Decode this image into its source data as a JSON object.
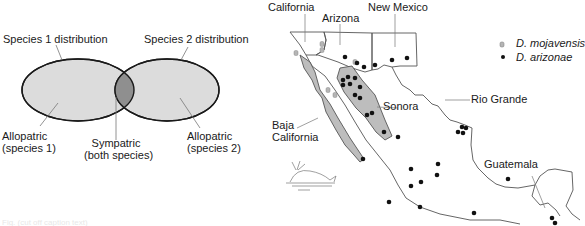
{
  "venn": {
    "labels": {
      "species1_distribution": "Species 1 distribution",
      "species2_distribution": "Species 2 distribution",
      "allopatric1_line1": "Allopatric",
      "allopatric1_line2": "(species 1)",
      "sympatric_line1": "Sympatric",
      "sympatric_line2": "(both species)",
      "allopatric2_line1": "Allopatric",
      "allopatric2_line2": "(species 2)"
    },
    "colors": {
      "fill": "#dcdcdc",
      "overlap": "#8f8f8f",
      "stroke": "#1a1a1a"
    }
  },
  "map": {
    "region_labels": {
      "california": "California",
      "arizona": "Arizona",
      "new_mexico": "New Mexico",
      "sonora": "Sonora",
      "rio_grande": "Rio Grande",
      "baja_california_line1": "Baja",
      "baja_california_line2": "California",
      "guatemala": "Guatemala"
    },
    "legend": [
      {
        "symbol": "gray-marker",
        "label": "D. mojavensis"
      },
      {
        "symbol": "black-dot",
        "label": "D. arizonae"
      }
    ],
    "colors": {
      "shaded_region": "#bdbdbd",
      "outline": "#555555",
      "arizonae_dot": "#111111",
      "mojavensis_marker": "#b5b5b5"
    },
    "arizonae_points": [
      [
        345,
        57
      ],
      [
        357,
        63
      ],
      [
        364,
        67
      ],
      [
        375,
        65
      ],
      [
        392,
        60
      ],
      [
        407,
        58
      ],
      [
        343,
        80
      ],
      [
        348,
        77
      ],
      [
        355,
        78
      ],
      [
        350,
        84
      ],
      [
        343,
        85
      ],
      [
        360,
        87
      ],
      [
        355,
        95
      ],
      [
        360,
        98
      ],
      [
        367,
        115
      ],
      [
        372,
        113
      ],
      [
        384,
        132
      ],
      [
        398,
        137
      ],
      [
        363,
        159
      ],
      [
        438,
        164
      ],
      [
        411,
        169
      ],
      [
        421,
        182
      ],
      [
        411,
        186
      ],
      [
        389,
        202
      ],
      [
        462,
        127
      ],
      [
        458,
        132
      ],
      [
        463,
        133
      ],
      [
        466,
        128
      ],
      [
        437,
        175
      ],
      [
        420,
        207
      ],
      [
        474,
        213
      ],
      [
        508,
        179
      ],
      [
        552,
        218
      ],
      [
        555,
        223
      ]
    ],
    "mojavensis_points": [
      [
        322,
        44
      ],
      [
        322,
        50
      ],
      [
        296,
        53
      ],
      [
        355,
        62
      ],
      [
        328,
        90
      ],
      [
        335,
        95
      ]
    ]
  },
  "caption": "Fig. (cut off caption text)"
}
